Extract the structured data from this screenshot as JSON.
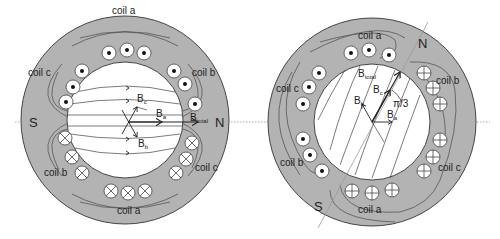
{
  "colors": {
    "stator": "#b3b3b3",
    "outline": "#444444",
    "bore": "#ffffff",
    "axis": "#999999"
  },
  "left": {
    "coils": {
      "top": "coil a",
      "bottom": "coil a",
      "upper_left": "coil c",
      "upper_right": "coil b",
      "lower_left": "coil b",
      "lower_right": "coil c"
    },
    "poles": {
      "south": "S",
      "north": "N"
    },
    "vectors": {
      "Bc": "B",
      "Bc_sub": "c",
      "Ba": "B",
      "Ba_sub": "a",
      "Bb": "B",
      "Bb_sub": "b",
      "Btotal": "B",
      "Btotal_sub": "total"
    }
  },
  "right": {
    "coils": {
      "top": "coil a",
      "bottom": "coil a",
      "upper_left": "coil c",
      "upper_right": "coil b",
      "lower_left": "coil b",
      "lower_right": "coil c"
    },
    "poles": {
      "south": "S",
      "north": "N"
    },
    "vectors": {
      "Btotal": "B",
      "Btotal_sub": "total",
      "Bc": "B",
      "Bc_sub": "c",
      "Bb": "B",
      "Bb_sub": "b",
      "Ba": "B",
      "Ba_sub": "a"
    },
    "angle_label": "π/3"
  }
}
